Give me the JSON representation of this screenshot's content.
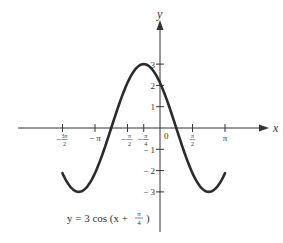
{
  "chart_data": {
    "type": "line",
    "equation": {
      "prefix": "y = 3 cos (x + ",
      "frac_num": "π",
      "frac_den": "4",
      "suffix": ")"
    },
    "xlabel": "x",
    "ylabel": "y",
    "grid": false,
    "legend": null,
    "xlim": [
      -4.712,
      3.1416
    ],
    "ylim": [
      -3,
      3
    ],
    "x_ticks": [
      {
        "value": -4.712389,
        "num": "3π",
        "den": "2",
        "neg": true
      },
      {
        "value": -3.141593,
        "label": "π",
        "neg": true
      },
      {
        "value": -1.570796,
        "num": "π",
        "den": "2",
        "neg": true
      },
      {
        "value": -0.785398,
        "num": "π",
        "den": "4",
        "neg": true
      },
      {
        "value": 0,
        "label": "0"
      },
      {
        "value": 1.570796,
        "num": "π",
        "den": "2",
        "neg": false
      },
      {
        "value": 3.141593,
        "label": "π",
        "neg": false
      }
    ],
    "y_ticks": [
      {
        "value": 3,
        "label": "3"
      },
      {
        "value": 2,
        "label": "2"
      },
      {
        "value": 1,
        "label": "1"
      },
      {
        "value": -1,
        "label": "− 1"
      },
      {
        "value": -2,
        "label": "− 2"
      },
      {
        "value": -3,
        "label": "− 3"
      }
    ],
    "series": [
      {
        "name": "y = 3 cos (x + π/4)",
        "amplitude": 3,
        "phase_shift": 0.785398,
        "x_range": [
          -4.712389,
          3.141593
        ],
        "key_points": [
          {
            "x": -4.712,
            "y": -2.12
          },
          {
            "x": -3.927,
            "y": -3
          },
          {
            "x": -2.356,
            "y": 0
          },
          {
            "x": -0.785,
            "y": 3
          },
          {
            "x": 0,
            "y": 2.12
          },
          {
            "x": 0.785,
            "y": 0
          },
          {
            "x": 2.356,
            "y": -3
          },
          {
            "x": 3.142,
            "y": -2.12
          }
        ],
        "color": "#2b2b2b"
      }
    ]
  }
}
